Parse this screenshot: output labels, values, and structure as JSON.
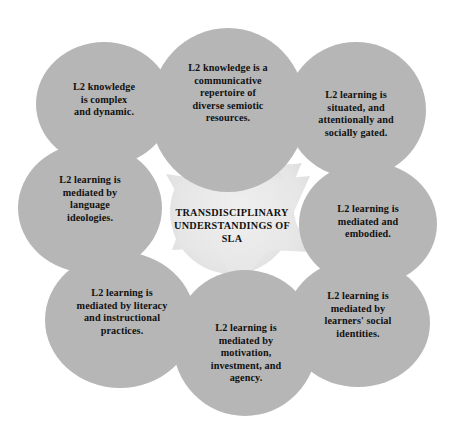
{
  "diagram": {
    "title": "Transdisciplinary Understandings of SLA",
    "type": "radial-petal-diagram",
    "colors": {
      "petal_fill": "#b6b6b6",
      "center_fill": "#e6e6e6",
      "background": "#ffffff",
      "text": "#111111"
    },
    "center": {
      "label": "TRANSDISCIPLINARY\nUNDERSTANDINGS OF\nSLA"
    },
    "petals": [
      {
        "id": "top",
        "position": "top-center",
        "label": "L2 knowledge is a\ncommunicative\nrepertoire of\ndiverse semiotic\nresources.",
        "cx": 228,
        "cy": 110,
        "rx": 78,
        "ry": 82,
        "tx": 228,
        "ty": 93
      },
      {
        "id": "top-left",
        "position": "top-left",
        "label": "L2 knowledge\nis complex\nand dynamic.",
        "cx": 104,
        "cy": 104,
        "rx": 68,
        "ry": 62,
        "tx": 104,
        "ty": 100
      },
      {
        "id": "top-right",
        "position": "top-right",
        "label": "L2 learning is\nsituated, and\nattentionally and\nsocially gated.",
        "cx": 356,
        "cy": 110,
        "rx": 70,
        "ry": 68,
        "tx": 356,
        "ty": 114
      },
      {
        "id": "left",
        "position": "middle-left",
        "label": "L2 learning is\nmediated by\nlanguage\nideologies.",
        "cx": 90,
        "cy": 208,
        "rx": 72,
        "ry": 65,
        "tx": 90,
        "ty": 199
      },
      {
        "id": "right",
        "position": "middle-right",
        "label": "L2 learning is\nmediated and\nembodied.",
        "cx": 368,
        "cy": 224,
        "rx": 69,
        "ry": 62,
        "tx": 368,
        "ty": 222
      },
      {
        "id": "bottom-left",
        "position": "bottom-left",
        "label": "L2 learning is\nmediated by literacy\nand instructional\npractices.",
        "cx": 120,
        "cy": 320,
        "rx": 75,
        "ry": 68,
        "tx": 122,
        "ty": 312
      },
      {
        "id": "bottom-right",
        "position": "bottom-right",
        "label": "L2 learning is\nmediated by\nlearners' social\nidentities.",
        "cx": 358,
        "cy": 323,
        "rx": 72,
        "ry": 64,
        "tx": 358,
        "ty": 315
      },
      {
        "id": "bottom",
        "position": "bottom-center",
        "label": "L2 learning is\nmediated by\nmotivation,\ninvestment, and\nagency.",
        "cx": 245,
        "cy": 343,
        "rx": 72,
        "ry": 73,
        "tx": 246,
        "ty": 353
      }
    ]
  }
}
